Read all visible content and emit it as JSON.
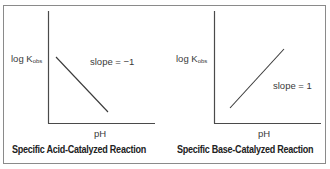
{
  "panels": [
    {
      "id": "acid",
      "y_label_main": "log K",
      "y_label_sub": "obs",
      "x_label": "pH",
      "annotation": "slope = −1",
      "caption": "Specific Acid-Catalyzed Reaction"
    },
    {
      "id": "base",
      "y_label_main": "log K",
      "y_label_sub": "obs",
      "x_label": "pH",
      "annotation": "slope = 1",
      "caption": "Specific Base-Catalyzed Reaction"
    }
  ],
  "colors": {
    "axis": "#4a4a4a",
    "line": "#3a3a3a",
    "frame": "#8a8a8a"
  }
}
